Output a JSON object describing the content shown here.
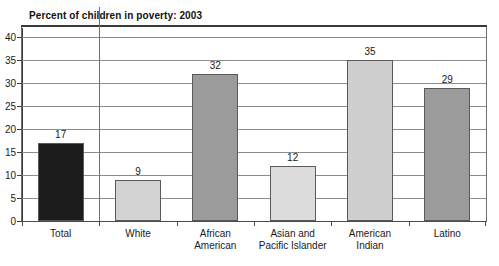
{
  "chart_data": {
    "type": "bar",
    "title": "Percent of children in poverty: 2003",
    "xlabel": "",
    "ylabel": "",
    "categories": [
      "Total",
      "White",
      "African\nAmerican",
      "Asian and\nPacific Islander",
      "American\nIndian",
      "Latino"
    ],
    "values": [
      17,
      9,
      32,
      12,
      35,
      29
    ],
    "value_labels": [
      "17",
      "9",
      "32",
      "12",
      "35",
      "29"
    ],
    "bar_colors": [
      "#1c1c1c",
      "#d2d2d2",
      "#9b9b9b",
      "#dcdcdc",
      "#cfcfcf",
      "#9b9b9b"
    ],
    "bar_border_color": "#5a5a5a",
    "ylim": [
      0,
      42
    ],
    "yticks": [
      0,
      5,
      10,
      15,
      20,
      25,
      30,
      35,
      40
    ],
    "ytick_labels": [
      "0",
      "5",
      "10",
      "15",
      "20",
      "25",
      "30",
      "35",
      "40"
    ],
    "grid": true,
    "grid_color": "#8c8c8c",
    "legend": null,
    "frame_color": "#6e6e6e",
    "title_rule_color": "#3a3a3a",
    "background": "#ffffff"
  }
}
